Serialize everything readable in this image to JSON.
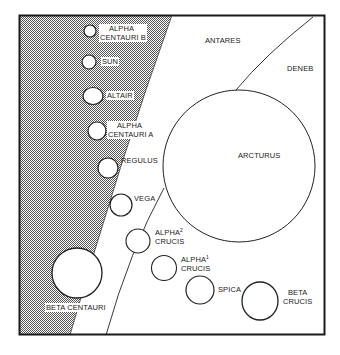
{
  "diagram": {
    "type": "relative-star-size-comparison",
    "frame": {
      "x": 19,
      "y": 15,
      "width": 306,
      "height": 320,
      "border_color": "#1a1a1a"
    },
    "regions": [
      {
        "name": "shaded-region",
        "fill": "dotted-gray"
      },
      {
        "label": "ANTARES"
      },
      {
        "label": "DENEB"
      }
    ],
    "stars": [
      {
        "id": "alpha-centauri-b",
        "label_line1": "ALPHA",
        "label_line2": "CENTAURI B",
        "cx": 90,
        "cy": 31,
        "r": 6
      },
      {
        "id": "sun",
        "label_line1": "SUN",
        "cx": 89,
        "cy": 62,
        "r": 7
      },
      {
        "id": "altair",
        "label_line1": "ALTAIR",
        "cx": 93,
        "cy": 96,
        "r": 9
      },
      {
        "id": "alpha-centauri-a",
        "label_line1": "ALPHA",
        "label_line2": "CENTAURI A",
        "cx": 97,
        "cy": 131,
        "r": 9
      },
      {
        "id": "regulus",
        "label_line1": "REGULUS",
        "cx": 108,
        "cy": 167,
        "r": 10
      },
      {
        "id": "arcturus",
        "label_line1": "ARCTURUS",
        "cx": 239,
        "cy": 166,
        "r": 76
      },
      {
        "id": "vega",
        "label_line1": "VEGA",
        "cx": 121,
        "cy": 205,
        "r": 11
      },
      {
        "id": "alpha2-crucis",
        "label_line1": "ALPHA",
        "sup": "2",
        "label_line2": "CRUCIS",
        "cx": 139,
        "cy": 241,
        "r": 12
      },
      {
        "id": "alpha1-crucis",
        "label_line1": "ALPHA",
        "sup": "1",
        "label_line2": "CRUCIS",
        "cx": 164,
        "cy": 268,
        "r": 12
      },
      {
        "id": "spica",
        "label_line1": "SPICA",
        "cx": 200,
        "cy": 290,
        "r": 14
      },
      {
        "id": "beta-crucis",
        "label_line1": "BETA",
        "label_line2": "CRUCIS",
        "cx": 261,
        "cy": 301,
        "r": 18
      },
      {
        "id": "beta-centauri",
        "label_line1": "BETA CENTAURI",
        "cx": 77,
        "cy": 273,
        "r": 25
      }
    ]
  }
}
